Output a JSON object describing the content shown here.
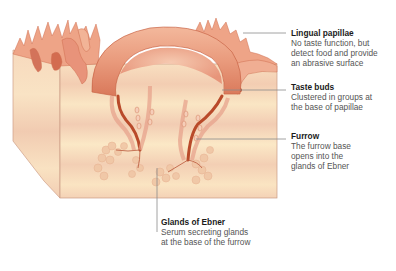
{
  "diagram": {
    "labels": [
      {
        "id": "lingual-papillae",
        "title": "Lingual papillae",
        "description": "No taste function, but\ndetect food and provide\nan abrasive surface"
      },
      {
        "id": "taste-buds",
        "title": "Taste buds",
        "description": "Clustered in groups at\nthe base of papillae"
      },
      {
        "id": "furrow",
        "title": "Furrow",
        "description": "The furrow base\nopens into the\nglands of Ebner"
      },
      {
        "id": "glands-of-ebner",
        "title": "Glands of Ebner",
        "description": "Serum secreting glands\nat the base of the furrow"
      }
    ],
    "colors": {
      "tissue_block": "#f9e2bd",
      "tissue_stripe": "#f3cfb0",
      "papilla_pink": "#eba184",
      "papilla_dark": "#c8603f",
      "furrow_red": "#b94a2a",
      "gland": "#f0c6a5",
      "leader_line": "#8a8a8a",
      "block_edge": "#c99a84"
    }
  }
}
